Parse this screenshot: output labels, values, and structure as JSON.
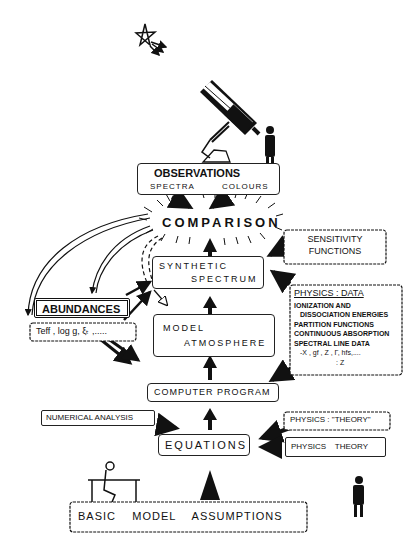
{
  "observations": {
    "title": "OBSERVATIONS",
    "spectra": "SPECTRA",
    "colours": "COLOURS"
  },
  "comparison": "COMPARISON",
  "sensitivity": {
    "line1": "SENSITIVITY",
    "line2": "FUNCTIONS"
  },
  "synthetic": {
    "line1": "SYNTHETIC",
    "line2": "SPECTRUM"
  },
  "physics_data": {
    "title": "PHYSICS : DATA",
    "lines": [
      "IONIZATION AND",
      "DISSOCIATION ENERGIES",
      "PARTITION FUNCTIONS",
      "CONTINUOUS ABSORPTION",
      "SPECTRAL LINE DATA",
      "-X , gf , Z , Γ, hfs,....",
      ":   Z"
    ]
  },
  "abundances": "ABUNDANCES",
  "params": "Teff  , log g,  ξₜ ,.....",
  "model": {
    "line1": "MODEL",
    "line2": "ATMOSPHERE"
  },
  "computer_program": "COMPUTER PROGRAM",
  "numerical_analysis": "NUMERICAL ANALYSIS",
  "physics_theory_quoted": "PHYSICS : \"THEORY\"",
  "physics_theory": "PHYSICS    THEORY",
  "equations": "EQUATIONS",
  "basic_assumptions": "BASIC    MODEL    ASSUMPTIONS",
  "colors": {
    "ink": "#111111",
    "background": "#ffffff"
  }
}
